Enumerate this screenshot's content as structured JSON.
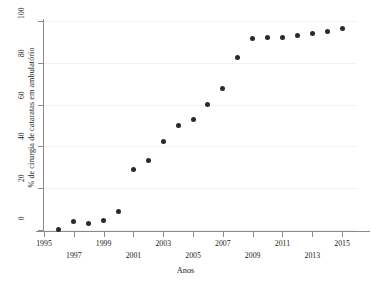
{
  "figure": {
    "ghost_watermark": "",
    "background_color": "#ffffff",
    "marker_color": "#2a2a2a",
    "axis_color": "#8a8a8a",
    "grid_color": "#f2f2f2"
  },
  "chart_data": {
    "type": "scatter",
    "title": "",
    "xlabel": "Anos",
    "ylabel": "% de cirurgia de cataratas em ambulatório",
    "xlim": [
      1995,
      2016
    ],
    "ylim": [
      0,
      100
    ],
    "grid": true,
    "legend": null,
    "xtick_labels": [
      "1995",
      "1997",
      "1999",
      "2001",
      "2003",
      "2005",
      "2007",
      "2009",
      "2011",
      "2013",
      "2015"
    ],
    "xtick_values": [
      1995,
      1997,
      1999,
      2001,
      2003,
      2005,
      2007,
      2009,
      2011,
      2013,
      2015
    ],
    "ytick_labels": [
      "0",
      "20",
      "40",
      "60",
      "80",
      "100"
    ],
    "ytick_values": [
      0,
      20,
      40,
      60,
      80,
      100
    ],
    "x": [
      1996,
      1997,
      1998,
      1999,
      2000,
      2001,
      2002,
      2003,
      2004,
      2005,
      2006,
      2007,
      2008,
      2009,
      2010,
      2011,
      2012,
      2013,
      2014,
      2015
    ],
    "y": [
      0.3,
      4.3,
      3.2,
      4.6,
      9.0,
      29.0,
      33.3,
      42.3,
      50.0,
      52.7,
      60.0,
      67.7,
      82.7,
      91.4,
      92.3,
      92.2,
      93.0,
      94.2,
      95.2,
      96.2
    ],
    "series": [
      {
        "name": "% de cirurgia de cataratas em ambulatório",
        "values": [
          0.3,
          4.3,
          3.2,
          4.6,
          9.0,
          29.0,
          33.3,
          42.3,
          50.0,
          52.7,
          60.0,
          67.7,
          82.7,
          91.4,
          92.3,
          92.2,
          93.0,
          94.2,
          95.2,
          96.2
        ]
      }
    ]
  }
}
